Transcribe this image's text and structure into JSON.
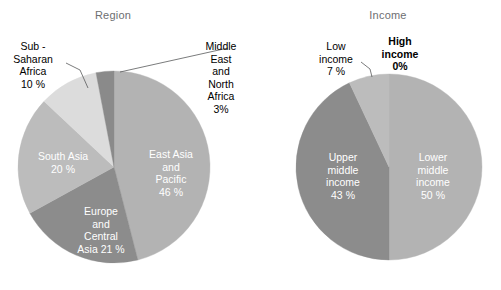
{
  "figure": {
    "width": 501,
    "height": 290,
    "background": "#ffffff"
  },
  "charts": [
    {
      "id": "region",
      "title": "Region",
      "center": [
        114,
        167
      ],
      "radius": 96
    },
    {
      "id": "income",
      "title": "Income",
      "center": [
        389,
        167
      ],
      "radius": 93
    }
  ],
  "labels": {
    "region": {
      "sub_saharan_africa": "Sub -\nSaharan\nAfrica\n10 %",
      "middle_east_north_africa": "Middle\nEast\nand\nNorth\nAfrica\n3%",
      "east_asia_pacific": "East Asia\nand\nPacific\n46 %",
      "europe_central_asia": "Europe\nand\nCentral\nAsia   21 %",
      "south_asia": "South Asia\n20 %"
    },
    "income": {
      "low_income": "Low\nincome\n7 %",
      "high_income": "High\nincome\n0%",
      "upper_middle_income": "Upper\nmiddle\nincome\n43 %",
      "lower_middle_income": "Lower\nmiddle\nincome\n50 %"
    }
  },
  "chart_data": [
    {
      "type": "pie",
      "title": "Region",
      "categories": [
        "East Asia and Pacific",
        "Europe and Central Asia",
        "South Asia",
        "Sub - Saharan Africa",
        "Middle East and North Africa"
      ],
      "values": [
        46,
        21,
        20,
        10,
        3
      ],
      "value_labels": [
        "46 %",
        "21 %",
        "20 %",
        "10 %",
        "3%"
      ],
      "colors": [
        "#b3b3b3",
        "#8c8c8c",
        "#bcbcbc",
        "#dcdcdc",
        "#8a8a8a"
      ],
      "label_colors": [
        "#ffffff",
        "#ffffff",
        "#ffffff",
        "#000000",
        "#000000"
      ],
      "start_angle_deg": 0,
      "direction": "clockwise",
      "legend": "none",
      "grid": false
    },
    {
      "type": "pie",
      "title": "Income",
      "categories": [
        "Lower middle income",
        "Upper middle income",
        "Low income",
        "High income"
      ],
      "values": [
        50,
        43,
        7,
        0
      ],
      "value_labels": [
        "50 %",
        "43 %",
        "7 %",
        "0%"
      ],
      "colors": [
        "#b3b3b3",
        "#8c8c8c",
        "#bcbcbc",
        "#cfcfcf"
      ],
      "label_colors": [
        "#ffffff",
        "#ffffff",
        "#000000",
        "#000000"
      ],
      "start_angle_deg": 0,
      "direction": "clockwise",
      "legend": "none",
      "grid": false
    }
  ],
  "leader_lines": [
    {
      "name": "sub-saharan-africa-leader",
      "points": "66,63 80,70 88,88"
    },
    {
      "name": "middle-east-north-africa-leader",
      "points": "120,72 228,48"
    },
    {
      "name": "low-income-leader",
      "points": "361,62 370,69 372,77"
    }
  ]
}
